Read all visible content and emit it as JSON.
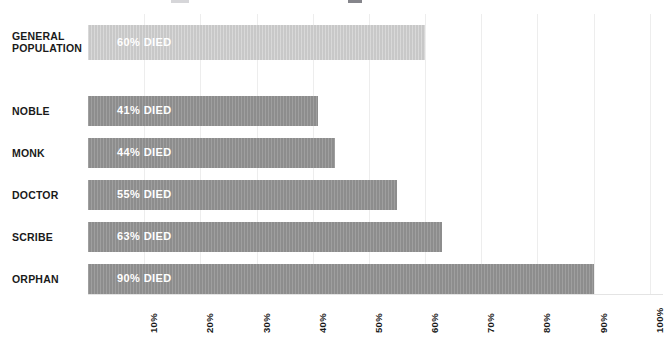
{
  "chart_data": {
    "type": "bar",
    "orientation": "horizontal",
    "title": "",
    "xlabel": "",
    "ylabel": "",
    "xlim": [
      0,
      100
    ],
    "grid": true,
    "legend": false,
    "categories": [
      "GENERAL POPULATION",
      "NOBLE",
      "MONK",
      "DOCTOR",
      "SCRIBE",
      "ORPHAN"
    ],
    "values": [
      60,
      41,
      44,
      55,
      63,
      90
    ],
    "data_labels": [
      "60% DIED",
      "41% DIED",
      "44% DIED",
      "55% DIED",
      "63% DIED",
      "90% DIED"
    ],
    "xticks": [
      10,
      20,
      30,
      40,
      50,
      60,
      70,
      80,
      90,
      100
    ],
    "xticklabels": [
      "10%",
      "20%",
      "30%",
      "40%",
      "50%",
      "60%",
      "70%",
      "80%",
      "90%",
      "100%"
    ],
    "bar_colors": [
      "#c8c8c8",
      "#8d8d8d",
      "#8d8d8d",
      "#8d8d8d",
      "#8d8d8d",
      "#8d8d8d"
    ],
    "colors": {
      "background": "#ffffff",
      "bar_highlight": "#c8c8c8",
      "bar_default": "#8d8d8d",
      "gridline": "#ededed",
      "label_text": "#1a1a1a",
      "value_text": "#ffffff"
    }
  },
  "rows": [
    {
      "label_line1": "GENERAL",
      "label_line2": "POPULATION",
      "value_label": "60% DIED"
    },
    {
      "label_line1": "NOBLE",
      "label_line2": "",
      "value_label": "41% DIED"
    },
    {
      "label_line1": "MONK",
      "label_line2": "",
      "value_label": "44% DIED"
    },
    {
      "label_line1": "DOCTOR",
      "label_line2": "",
      "value_label": "55% DIED"
    },
    {
      "label_line1": "SCRIBE",
      "label_line2": "",
      "value_label": "63% DIED"
    },
    {
      "label_line1": "ORPHAN",
      "label_line2": "",
      "value_label": "90% DIED"
    }
  ]
}
